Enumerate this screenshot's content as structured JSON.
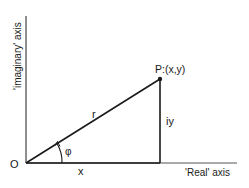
{
  "diagram": {
    "axes": {
      "real_label": "'Real' axis",
      "imaginary_label": "'imaginary' axis"
    },
    "labels": {
      "origin": "O",
      "point": "P:(x,y)",
      "radius": "r",
      "imaginary_part": "iy",
      "real_part": "x",
      "angle": "φ"
    },
    "colors": {
      "line": "#1a1a1a",
      "axis": "#555555",
      "background": "#ffffff"
    }
  }
}
